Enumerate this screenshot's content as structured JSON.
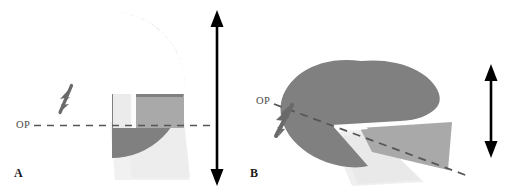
{
  "figure": {
    "title": "",
    "background_color": "#ffffff",
    "width": 523,
    "height": 193
  },
  "colors": {
    "dome_gray": "#808080",
    "wedge_mid_gray": "#a8a8a8",
    "wedge_light": "#e8e8e8",
    "wedge_pale": "#f0f0f0",
    "arrow_gray": "#6e6e6e",
    "dash_gray": "#555555",
    "label_black": "#1a1a1a",
    "op_text": "#4a4a4a"
  },
  "panels": [
    {
      "id": "A",
      "label": "A",
      "op_label": "OP",
      "orientation": "face-on",
      "occlusal_plane": "horizontal",
      "pointer_direction": "down-left",
      "height_indicator": "full"
    },
    {
      "id": "B",
      "label": "B",
      "op_label": "OP",
      "orientation": "oblique-tilted",
      "occlusal_plane": "oblique",
      "pointer_direction": "up-right",
      "height_indicator": "reduced"
    }
  ],
  "icons": {
    "double_arrow": "double-headed-vertical-arrow",
    "pointer": "solid-arrow-pointer",
    "dashed_line": "dashed-reference-line"
  },
  "measurements": {
    "arrow_a_label": "",
    "arrow_b_label": ""
  }
}
